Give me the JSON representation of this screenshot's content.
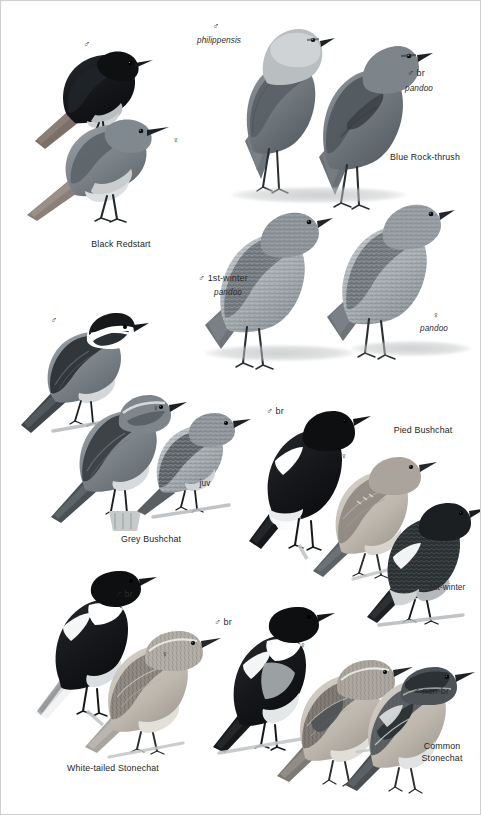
{
  "page": {
    "type": "field-guide-plate",
    "width": 481,
    "height": 815,
    "background": "#ffffff",
    "border_color": "#cfcfcf",
    "palette": {
      "ink": "#2b2b2b",
      "black_plumage": "#16181a",
      "dark_grey": "#3f4448",
      "mid_grey": "#6f767b",
      "light_grey": "#a9b0b4",
      "pale": "#d6dadc",
      "warm_pale": "#c9c3bb",
      "ground": "#b9bcbd"
    }
  },
  "species": [
    {
      "id": "black-redstart",
      "name": "Black Redstart",
      "name_x": 120,
      "name_y": 243,
      "figures": [
        {
          "id": "br-male",
          "label": "♂",
          "sub": "",
          "label_x": 86,
          "label_y": 44
        },
        {
          "id": "br-female",
          "label": "♀",
          "sub": "",
          "label_x": 175,
          "label_y": 140
        }
      ]
    },
    {
      "id": "blue-rock-thrush",
      "name": "Blue Rock-thrush",
      "name_x": 424,
      "name_y": 157,
      "figures": [
        {
          "id": "brt-male-philippensis",
          "label": "♂",
          "sub": "philippensis",
          "label_x": 215,
          "label_y": 26,
          "sub_x": 218,
          "sub_y": 41
        },
        {
          "id": "brt-male-br-pandoo",
          "label": "♂ br",
          "sub": "pandoo",
          "label_x": 415,
          "label_y": 73,
          "sub_x": 418,
          "sub_y": 89
        },
        {
          "id": "brt-male-1w-pandoo",
          "label": "♂ 1st-winter",
          "sub": "pandoo",
          "label_x": 222,
          "label_y": 278,
          "sub_x": 227,
          "sub_y": 293
        },
        {
          "id": "brt-female-pandoo",
          "label": "♀",
          "sub": "pandoo",
          "label_x": 435,
          "label_y": 315,
          "sub_x": 433,
          "sub_y": 329
        }
      ]
    },
    {
      "id": "grey-bushchat",
      "name": "Grey Bushchat",
      "name_x": 150,
      "name_y": 538,
      "figures": [
        {
          "id": "gb-male",
          "label": "♂",
          "sub": "",
          "label_x": 53,
          "label_y": 320
        },
        {
          "id": "gb-female",
          "label": "♀",
          "sub": "",
          "label_x": 155,
          "label_y": 408
        },
        {
          "id": "gb-juv",
          "label": "juv",
          "sub": "",
          "label_x": 204,
          "label_y": 483
        }
      ]
    },
    {
      "id": "pied-bushchat",
      "name": "Pied Bushchat",
      "name_x": 422,
      "name_y": 430,
      "figures": [
        {
          "id": "pb-male-br",
          "label": "♂ br",
          "sub": "",
          "label_x": 274,
          "label_y": 411
        },
        {
          "id": "pb-female",
          "label": "♀",
          "sub": "",
          "label_x": 343,
          "label_y": 456
        },
        {
          "id": "pb-male-1w",
          "label": "♂",
          "sub": "1st-winter",
          "label_x": 443,
          "label_y": 573,
          "sub_x": 446,
          "sub_y": 588
        }
      ]
    },
    {
      "id": "white-tailed-stonechat",
      "name": "White-tailed Stonechat",
      "name_x": 112,
      "name_y": 767,
      "figures": [
        {
          "id": "wts-male-br",
          "label": "♂ br",
          "sub": "",
          "label_x": 123,
          "label_y": 594
        },
        {
          "id": "wts-female",
          "label": "♀",
          "sub": "",
          "label_x": 164,
          "label_y": 654
        }
      ]
    },
    {
      "id": "common-stonechat",
      "name": "Common\nStonechat",
      "name_x": 441,
      "name_y": 746,
      "figures": [
        {
          "id": "cs-male-br",
          "label": "♂ br",
          "sub": "",
          "label_x": 222,
          "label_y": 622
        },
        {
          "id": "cs-female",
          "label": "♀",
          "sub": "",
          "label_x": 302,
          "label_y": 645
        },
        {
          "id": "cs-male-non-br",
          "label": "♂ non-br",
          "sub": "",
          "label_x": 430,
          "label_y": 691
        }
      ]
    }
  ]
}
